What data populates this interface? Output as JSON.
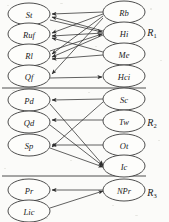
{
  "diagram": {
    "background_color": "#fbfbf9",
    "node_fill": "#fdfdfb",
    "node_stroke": "#3a3a3a",
    "edge_color": "#2e2e2e",
    "regions": [
      {
        "id": "R1",
        "base": "R",
        "subscript": "1",
        "label": "R₁",
        "x": 152,
        "y": 32
      },
      {
        "id": "R2",
        "base": "R",
        "subscript": "2",
        "label": "R₂",
        "x": 152,
        "y": 122
      },
      {
        "id": "R3",
        "base": "R",
        "subscript": "3",
        "label": "R₃",
        "x": 152,
        "y": 192
      }
    ],
    "dividers": [
      {
        "y": 88,
        "x1": 2,
        "x2": 146
      },
      {
        "y": 176,
        "x1": 2,
        "x2": 146
      }
    ],
    "nodes": [
      {
        "id": "St",
        "label": "St",
        "region": "R1",
        "side": "left",
        "cx": 29,
        "cy": 14,
        "rx": 21,
        "ry": 11
      },
      {
        "id": "Ruf",
        "label": "Ruf",
        "region": "R1",
        "side": "left",
        "cx": 29,
        "cy": 34,
        "rx": 21,
        "ry": 11
      },
      {
        "id": "Rl",
        "label": "Rl",
        "region": "R1",
        "side": "left",
        "cx": 29,
        "cy": 55,
        "rx": 21,
        "ry": 11
      },
      {
        "id": "Qf",
        "label": "Qf",
        "region": "R1",
        "side": "left",
        "cx": 29,
        "cy": 76,
        "rx": 21,
        "ry": 11
      },
      {
        "id": "Rb",
        "label": "Rb",
        "region": "R1",
        "side": "right",
        "cx": 124,
        "cy": 12,
        "rx": 21,
        "ry": 11
      },
      {
        "id": "Hi",
        "label": "Hi",
        "region": "R1",
        "side": "right",
        "cx": 124,
        "cy": 33,
        "rx": 21,
        "ry": 11
      },
      {
        "id": "Me",
        "label": "Me",
        "region": "R1",
        "side": "right",
        "cx": 124,
        "cy": 54,
        "rx": 21,
        "ry": 11
      },
      {
        "id": "Hci",
        "label": "Hci",
        "region": "R1",
        "side": "right",
        "cx": 124,
        "cy": 76,
        "rx": 21,
        "ry": 11
      },
      {
        "id": "Pd",
        "label": "Pd",
        "region": "R2",
        "side": "left",
        "cx": 29,
        "cy": 100,
        "rx": 21,
        "ry": 11
      },
      {
        "id": "Qd",
        "label": "Qd",
        "region": "R2",
        "side": "left",
        "cx": 29,
        "cy": 122,
        "rx": 21,
        "ry": 11
      },
      {
        "id": "Sp",
        "label": "Sp",
        "region": "R2",
        "side": "left",
        "cx": 29,
        "cy": 145,
        "rx": 21,
        "ry": 11
      },
      {
        "id": "Sc",
        "label": "Sc",
        "region": "R2",
        "side": "right",
        "cx": 124,
        "cy": 99,
        "rx": 21,
        "ry": 11
      },
      {
        "id": "Tw",
        "label": "Tw",
        "region": "R2",
        "side": "right",
        "cx": 124,
        "cy": 121,
        "rx": 21,
        "ry": 11
      },
      {
        "id": "Ot",
        "label": "Ot",
        "region": "R2",
        "side": "right",
        "cx": 124,
        "cy": 145,
        "rx": 21,
        "ry": 11
      },
      {
        "id": "Ic",
        "label": "Ic",
        "region": "R2",
        "side": "right",
        "cx": 124,
        "cy": 166,
        "rx": 21,
        "ry": 11
      },
      {
        "id": "Pr",
        "label": "Pr",
        "region": "R3",
        "side": "left",
        "cx": 29,
        "cy": 190,
        "rx": 21,
        "ry": 11
      },
      {
        "id": "Lic",
        "label": "Lic",
        "region": "R3",
        "side": "left",
        "cx": 29,
        "cy": 211,
        "rx": 21,
        "ry": 11
      },
      {
        "id": "NPr",
        "label": "NPr",
        "region": "R3",
        "side": "right",
        "cx": 124,
        "cy": 190,
        "rx": 21,
        "ry": 11
      }
    ],
    "edges": [
      {
        "from": "Rb",
        "to": "St",
        "x1": 103,
        "y1": 12,
        "x2": 52,
        "y2": 14
      },
      {
        "from": "Rb",
        "to": "Ruf",
        "x1": 103,
        "y1": 14,
        "x2": 52,
        "y2": 33
      },
      {
        "from": "Rb",
        "to": "Rl",
        "x1": 103,
        "y1": 16,
        "x2": 52,
        "y2": 54
      },
      {
        "from": "Rb",
        "to": "Qf",
        "x1": 103,
        "y1": 18,
        "x2": 52,
        "y2": 74
      },
      {
        "from": "Hi",
        "to": "St",
        "x1": 103,
        "y1": 31,
        "x2": 52,
        "y2": 17
      },
      {
        "from": "Hi",
        "to": "Ruf",
        "x1": 103,
        "y1": 33,
        "x2": 52,
        "y2": 36
      },
      {
        "from": "Hi",
        "to": "Rl",
        "x1": 103,
        "y1": 35,
        "x2": 52,
        "y2": 57
      },
      {
        "from": "Me",
        "to": "Ruf",
        "x1": 103,
        "y1": 52,
        "x2": 52,
        "y2": 38
      },
      {
        "from": "Me",
        "to": "Rl",
        "x1": 103,
        "y1": 55,
        "x2": 52,
        "y2": 59
      },
      {
        "from": "St",
        "to": "Hi",
        "x1": 50,
        "y1": 20,
        "x2": 102,
        "y2": 32
      },
      {
        "from": "Rl",
        "to": "Hi",
        "x1": 50,
        "y1": 51,
        "x2": 102,
        "y2": 34
      },
      {
        "from": "Qf",
        "to": "Hci",
        "x1": 50,
        "y1": 78,
        "x2": 102,
        "y2": 77
      },
      {
        "from": "Sc",
        "to": "Pd",
        "x1": 103,
        "y1": 99,
        "x2": 52,
        "y2": 100
      },
      {
        "from": "Tw",
        "to": "Qd",
        "x1": 103,
        "y1": 120,
        "x2": 52,
        "y2": 120
      },
      {
        "from": "Ot",
        "to": "Sp",
        "x1": 103,
        "y1": 145,
        "x2": 52,
        "y2": 145
      },
      {
        "from": "Sc",
        "to": "Sp",
        "x1": 103,
        "y1": 102,
        "x2": 52,
        "y2": 147
      },
      {
        "from": "Pd",
        "to": "Ic",
        "x1": 50,
        "y1": 104,
        "x2": 103,
        "y2": 165
      },
      {
        "from": "Qd",
        "to": "Ic",
        "x1": 50,
        "y1": 125,
        "x2": 103,
        "y2": 166
      },
      {
        "from": "Sp",
        "to": "Ic",
        "x1": 50,
        "y1": 148,
        "x2": 103,
        "y2": 167
      },
      {
        "from": "NPr",
        "to": "Pr",
        "x1": 103,
        "y1": 190,
        "x2": 52,
        "y2": 190
      },
      {
        "from": "Lic",
        "to": "NPr",
        "x1": 50,
        "y1": 208,
        "x2": 103,
        "y2": 191
      }
    ]
  }
}
